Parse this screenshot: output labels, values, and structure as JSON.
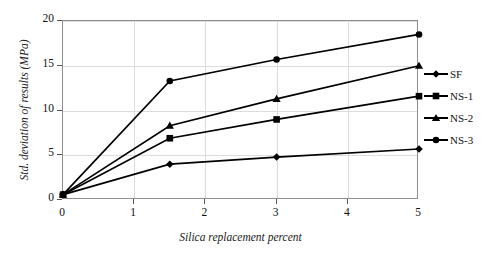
{
  "chart_data": {
    "type": "line",
    "title": "",
    "xlabel": "Silica replacement percent",
    "ylabel": "Std. deviation of results (MPa)",
    "x": [
      0,
      1.5,
      3,
      5
    ],
    "xlim": [
      0,
      5
    ],
    "ylim": [
      0,
      20
    ],
    "xticks": [
      "0",
      "1",
      "2",
      "3",
      "4",
      "5"
    ],
    "yticks": [
      "0",
      "5",
      "10",
      "15",
      "20"
    ],
    "grid": true,
    "legend_position": "right",
    "series": [
      {
        "name": "SF",
        "marker": "diamond",
        "values": [
          0.6,
          4.0,
          4.8,
          5.7
        ]
      },
      {
        "name": "NS-1",
        "marker": "square",
        "values": [
          0.6,
          6.9,
          9.0,
          11.6
        ]
      },
      {
        "name": "NS-2",
        "marker": "triangle",
        "values": [
          0.6,
          8.3,
          11.3,
          15.0
        ]
      },
      {
        "name": "NS-3",
        "marker": "circle",
        "values": [
          0.6,
          13.3,
          15.7,
          18.5
        ]
      }
    ],
    "line_color": "#000000",
    "grid_color": "#dcdcdc",
    "frame_color": "#8e8e8e"
  },
  "legend": {
    "items": [
      {
        "label": "SF"
      },
      {
        "label": "NS-1"
      },
      {
        "label": "NS-2"
      },
      {
        "label": "NS-3"
      }
    ]
  }
}
